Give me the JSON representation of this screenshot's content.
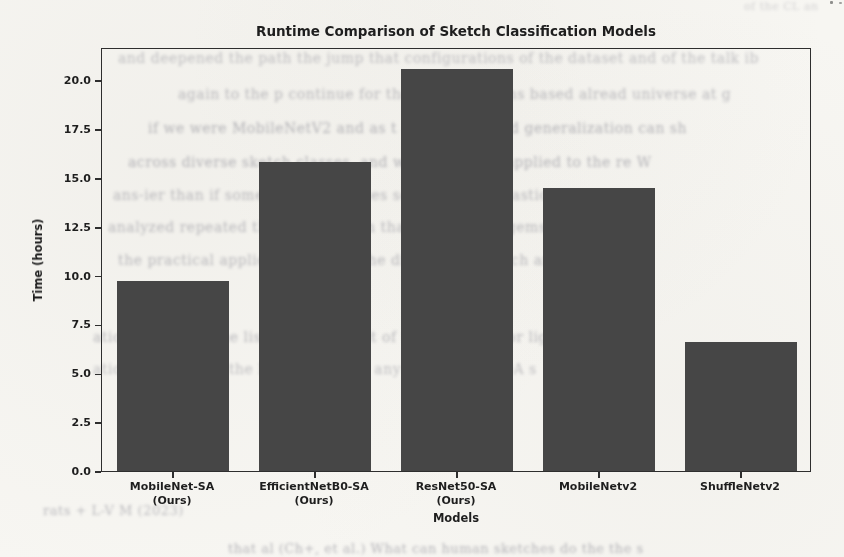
{
  "page": {
    "background": "#f7f6f2"
  },
  "chart_data": {
    "type": "bar",
    "title": "Runtime Comparison of Sketch Classification Models",
    "xlabel": "Models",
    "ylabel": "Time (hours)",
    "categories": [
      {
        "line1": "MobileNet-SA",
        "line2": "(Ours)"
      },
      {
        "line1": "EfficientNetB0-SA",
        "line2": "(Ours)"
      },
      {
        "line1": "ResNet50-SA",
        "line2": "(Ours)"
      },
      {
        "line1": "MobileNetv2",
        "line2": ""
      },
      {
        "line1": "ShuffleNetv2",
        "line2": ""
      }
    ],
    "values": [
      9.7,
      15.8,
      20.6,
      14.5,
      6.6
    ],
    "ylim": [
      0,
      21.7
    ],
    "yticks": [
      "0.0",
      "2.5",
      "5.0",
      "7.5",
      "10.0",
      "12.5",
      "15.0",
      "17.5",
      "20.0"
    ],
    "grid": false,
    "legend": "none",
    "bar_color": "#464646",
    "axis_color": "#2e2e2e",
    "text_color": "#1e1e1e"
  },
  "bleed_through": {
    "note": "illegible show-through text from reverse side of scanned page",
    "fragments": [
      {
        "x": 118,
        "y": 50,
        "size": 14,
        "op": 0.45,
        "text": "and deepened the path the jump that configurations of the dataset and of the talk ib"
      },
      {
        "x": 178,
        "y": 86,
        "size": 14,
        "op": 0.5,
        "text": "again to the p continue for the configurations based alread universe at g"
      },
      {
        "x": 148,
        "y": 120,
        "size": 14,
        "op": 0.55,
        "text": "if we were MobileNetV2 and as t and at best and generalization can sh"
      },
      {
        "x": 128,
        "y": 154,
        "size": 14,
        "op": 0.55,
        "text": "across diverse sketch classes, and was made and applied to the re W"
      },
      {
        "x": 113,
        "y": 187,
        "size": 14,
        "op": 0.5,
        "text": "ans-ier than if some open en classes soon after its elastic per s"
      },
      {
        "x": 108,
        "y": 219,
        "size": 14,
        "op": 0.5,
        "text": "analyzed repeated the cost more in that ana in both gems provide by"
      },
      {
        "x": 118,
        "y": 252,
        "size": 14,
        "op": 0.5,
        "text": "the practical application and to the distance of sketch arr"
      },
      {
        "x": 93,
        "y": 329,
        "size": 14,
        "op": 0.5,
        "text": "ation In-depth. The list of the dataset of t and weight for light b"
      },
      {
        "x": 93,
        "y": 361,
        "size": 14,
        "op": 0.45,
        "text": "ation methods on the list technic for any to w VL and DA s"
      },
      {
        "x": 43,
        "y": 503,
        "size": 13,
        "op": 0.5,
        "text": "rats + L-V M (2023)"
      },
      {
        "x": 228,
        "y": 541,
        "size": 13,
        "op": 0.55,
        "text": "that al (Ch+, et al.) What can human sketches do the the s"
      },
      {
        "x": 744,
        "y": 0,
        "size": 11,
        "op": 0.3,
        "text": "of the CL an"
      }
    ]
  }
}
